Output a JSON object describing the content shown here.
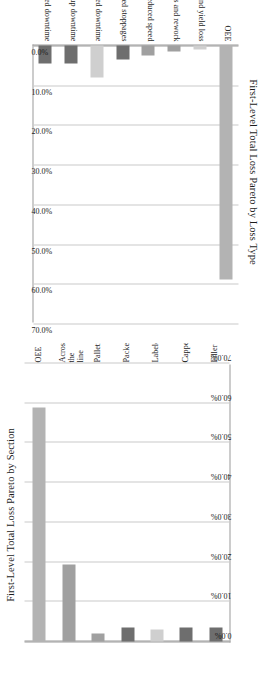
{
  "document": {
    "kind": "figure-page",
    "background": "#ffffff"
  },
  "palette": {
    "bar_dark": "#6e6e6e",
    "bar_mid": "#a0a0a0",
    "bar_light": "#cfcfcf",
    "bar_oee": "#b3b3b3",
    "gridline": "#c9c9c9",
    "axis": "#9a9a9a",
    "text": "#1b1b1b"
  },
  "charts": [
    {
      "id": "pareto-loss-type",
      "title": "First-Level Total Loss Pareto by Loss Type",
      "orientation": "upside-down",
      "chart_data": {
        "type": "bar",
        "title": "First-Level Total Loss Pareto by Loss Type",
        "xlabel": "",
        "ylabel": "",
        "ylim": [
          0,
          70
        ],
        "grid": true,
        "legend": "none",
        "tick_format": "percent",
        "categories": [
          "Planned downtime",
          "Setup downtime",
          "Unplanned recorded downtime",
          "Minor unrecorded stoppages",
          "Reduced speed",
          "Rejects and rework",
          "Start-up and yield loss",
          "OEE"
        ],
        "values": [
          4.5,
          4.5,
          8.0,
          3.5,
          2.5,
          1.5,
          1.0,
          59.0
        ],
        "tick_labels": [
          "0.0%",
          "10.0%",
          "20.0%",
          "30.0%",
          "40.0%",
          "50.0%",
          "60.0%",
          "70.0%"
        ],
        "ticks": [
          0,
          10,
          20,
          30,
          40,
          50,
          60,
          70
        ],
        "bar_colors": [
          "#6e6e6e",
          "#6e6e6e",
          "#cfcfcf",
          "#6e6e6e",
          "#a0a0a0",
          "#a0a0a0",
          "#cfcfcf",
          "#b3b3b3"
        ]
      }
    },
    {
      "id": "pareto-section",
      "title": "First-Level Total Loss Pareto by Section",
      "orientation": "rotated-ccw",
      "chart_data": {
        "type": "bar",
        "title": "First-Level Total Loss Pareto by Section",
        "xlabel": "",
        "ylabel": "",
        "ylim": [
          0,
          70
        ],
        "grid": true,
        "legend": "none",
        "tick_format": "percent",
        "categories": [
          "Filler",
          "Capper",
          "Labeler",
          "Packer",
          "Palletizer",
          "Across\nthe line",
          "OEE"
        ],
        "category_display": [
          "Filler",
          "Capper",
          "Labeler",
          "Packer",
          "Palletizer",
          "Across the line",
          "OEE"
        ],
        "values": [
          3.5,
          3.5,
          3.0,
          3.5,
          2.0,
          19.5,
          59.0
        ],
        "tick_labels": [
          "0.0%",
          "10.0%",
          "20.0%",
          "30.0%",
          "40.0%",
          "50.0%",
          "60.0%",
          "70.0%"
        ],
        "ticks": [
          0,
          10,
          20,
          30,
          40,
          50,
          60,
          70
        ],
        "bar_colors": [
          "#6e6e6e",
          "#6e6e6e",
          "#cfcfcf",
          "#6e6e6e",
          "#a0a0a0",
          "#a0a0a0",
          "#b3b3b3"
        ]
      }
    }
  ]
}
